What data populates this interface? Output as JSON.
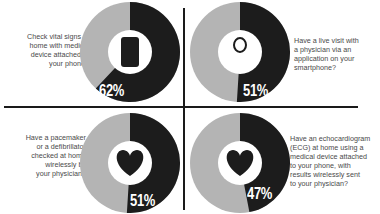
{
  "colors": {
    "yes": "#1c1c1c",
    "no": "#b4b4b4",
    "center": "#ffffff",
    "text": "#4a4a4a",
    "divider": "#1a1a1a"
  },
  "chart_data": {
    "type": "pie",
    "variant": "donut",
    "layout": "2x2 grid",
    "charts": [
      {
        "question": "Check vital signs at home with medical device attached to your phone?",
        "value": 62,
        "label": "62%",
        "icon": "smartphone-heartbeat-icon"
      },
      {
        "question": "Have a live visit with a physician via an application on your smartphone?",
        "value": 51,
        "label": "51%",
        "icon": "doctor-stethoscope-icon"
      },
      {
        "question": "Have a pacemaker or a defibrillator checked at home wirelessly by your physician?",
        "value": 51,
        "label": "51%",
        "icon": "heart-lightning-icon"
      },
      {
        "question": "Have an echocardiogram (ECG) at home using a medical device attached to your phone, with results wirelessly sent to your physician?",
        "value": 47,
        "label": "47%",
        "icon": "heart-ecg-icon"
      }
    ],
    "series": [
      {
        "name": "Yes (dark)",
        "values": [
          62,
          51,
          51,
          47
        ]
      },
      {
        "name": "Remainder (gray)",
        "values": [
          38,
          49,
          49,
          53
        ]
      }
    ],
    "categories": [
      "Vital signs via phone device",
      "Live physician app visit",
      "Pacemaker/defibrillator wireless check",
      "ECG via phone device"
    ]
  },
  "panels": {
    "tl": {
      "lines": [
        "Check vital signs at",
        "home with medical",
        "device attached to",
        "your phone?"
      ],
      "pct": "62%"
    },
    "tr": {
      "lines": [
        "Have a live visit with",
        "a physician via an",
        "application on your",
        "smartphone?"
      ],
      "pct": "51%"
    },
    "bl": {
      "lines": [
        "Have a pacemaker",
        "or a defibrillator",
        "checked at home",
        "wirelessly by",
        "your physician?"
      ],
      "pct": "51%"
    },
    "br": {
      "lines": [
        "Have an echocardiogram",
        "(ECG) at home using a",
        "medical device attached",
        "to your phone, with",
        "results wirelessly sent",
        "to your physician?"
      ],
      "pct": "47%",
      "icon_text": "ECG"
    }
  }
}
